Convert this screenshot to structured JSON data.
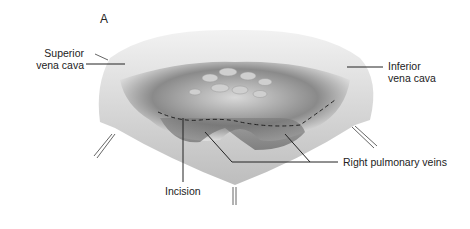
{
  "figure": {
    "panel_label": "A",
    "labels": {
      "svc_line1": "Superior",
      "svc_line2": "vena cava",
      "ivc_line1": "Inferior",
      "ivc_line2": "vena cava",
      "rpv": "Right pulmonary veins",
      "incision": "Incision"
    },
    "colors": {
      "ink": "#222222",
      "shade_dark": "#555555",
      "shade_mid": "#9a9a9a",
      "shade_light": "#e6e6e6"
    }
  }
}
